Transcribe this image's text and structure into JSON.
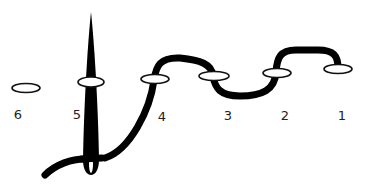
{
  "diagram": {
    "type": "stitching-sequence",
    "colors": {
      "thread": "#000000",
      "hole_fill": "#ffffff",
      "hole_stroke": "#111111",
      "label": "#222222",
      "background": "#ffffff"
    },
    "holes": [
      {
        "label": "6",
        "cx": 26,
        "cy": 88
      },
      {
        "label": "5",
        "cx": 91,
        "cy": 82
      },
      {
        "label": "4",
        "cx": 155,
        "cy": 79
      },
      {
        "label": "3",
        "cx": 214,
        "cy": 75
      },
      {
        "label": "2",
        "cx": 277,
        "cy": 73
      },
      {
        "label": "1",
        "cx": 338,
        "cy": 69
      }
    ],
    "labels": [
      {
        "text": "6",
        "x": 18,
        "y": 108
      },
      {
        "text": "5",
        "x": 77,
        "y": 108
      },
      {
        "text": "4",
        "x": 162,
        "y": 110
      },
      {
        "text": "3",
        "x": 228,
        "y": 109
      },
      {
        "text": "2",
        "x": 285,
        "y": 109
      },
      {
        "text": "1",
        "x": 342,
        "y": 109
      }
    ],
    "needle_icon": "needle-icon"
  }
}
